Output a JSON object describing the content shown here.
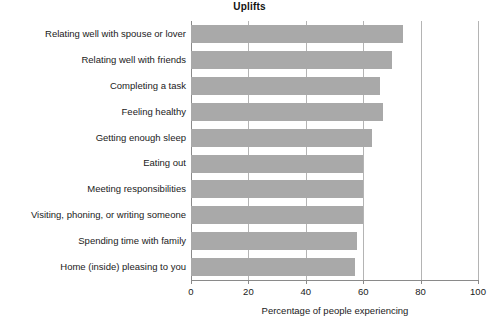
{
  "chart_data": {
    "type": "bar",
    "orientation": "horizontal",
    "title": "Uplifts",
    "xlabel": "Percentage of people experiencing",
    "ylabel": "",
    "xlim": [
      0,
      100
    ],
    "xticks": [
      0,
      20,
      40,
      60,
      80,
      100
    ],
    "grid": "vertical",
    "legend": null,
    "bar_color": "#a9a9a9",
    "categories": [
      "Relating well with spouse or lover",
      "Relating well with friends",
      "Completing a task",
      "Feeling healthy",
      "Getting enough sleep",
      "Eating out",
      "Meeting responsibilities",
      "Visiting, phoning, or writing someone",
      "Spending time with family",
      "Home (inside) pleasing to you"
    ],
    "values": [
      74,
      70,
      66,
      67,
      63,
      60,
      60,
      60,
      58,
      57
    ]
  }
}
